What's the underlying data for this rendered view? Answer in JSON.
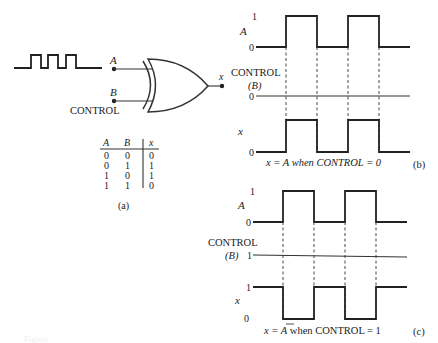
{
  "circuit": {
    "input_a_label": "A",
    "input_b_label": "B",
    "control_label": "CONTROL",
    "output_label": "x",
    "gate_type": "XOR"
  },
  "truth_table": {
    "headers": [
      "A",
      "B",
      "x"
    ],
    "rows": [
      [
        "0",
        "0",
        "0"
      ],
      [
        "0",
        "1",
        "1"
      ],
      [
        "1",
        "0",
        "1"
      ],
      [
        "1",
        "1",
        "0"
      ]
    ],
    "caption": "(a)"
  },
  "panel_b": {
    "a_label": "A",
    "a_one": "1",
    "a_zero": "0",
    "control_label": "CONTROL",
    "control_sub": "(B)",
    "control_level": "0",
    "x_label": "x",
    "x_zero": "0",
    "caption_pre": "x = A when CONTROL = 0",
    "tag": "(b)"
  },
  "panel_c": {
    "a_label": "A",
    "a_one": "1",
    "a_zero": "0",
    "control_label": "CONTROL",
    "control_sub": "(B)",
    "control_level": "1",
    "x_label": "x",
    "x_one": "1",
    "x_zero": "0",
    "caption_x": "x = ",
    "caption_abar": "A",
    "caption_post": " when CONTROL = 1",
    "tag": "(c)"
  },
  "figure_caption": "Figure"
}
